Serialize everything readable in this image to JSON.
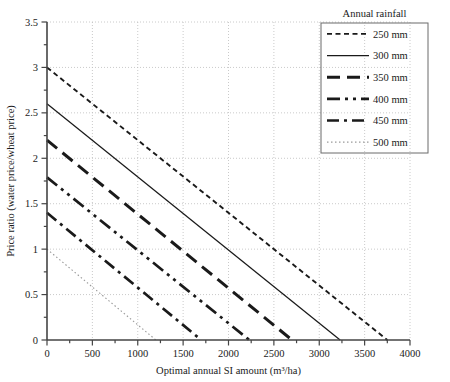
{
  "chart_data": {
    "type": "line",
    "title": "",
    "xlabel": "Optimal annual SI amount (m³/ha)",
    "ylabel": "Price ratio (water price/wheat price)",
    "xlim": [
      0,
      4000
    ],
    "ylim": [
      0,
      3.5
    ],
    "xticks": [
      0,
      500,
      1000,
      1500,
      2000,
      2500,
      3000,
      3500,
      4000
    ],
    "xtick_labels": [
      "0",
      "500",
      "1000",
      "1500",
      "2000",
      "2500",
      "3000",
      "3500",
      "4000"
    ],
    "yticks": [
      0,
      0.5,
      1,
      1.5,
      2,
      2.5,
      3,
      3.5
    ],
    "ytick_labels": [
      "0",
      "0.5",
      "1",
      "1.5",
      "2",
      "2.5",
      "3",
      "3.5"
    ],
    "x_minor_step": 250,
    "y_minor_step": 0.25,
    "grid": true,
    "grid_style": "dotted",
    "grid_color": "#bdbdbd",
    "legend_position": "top-right-outside",
    "legend_title": "Annual rainfall",
    "series": [
      {
        "name": "250 mm",
        "label": "250 mm",
        "style": "dashed-fine",
        "dasharray": "5,3.5",
        "width": 1.9,
        "color": "#1a1a1a",
        "x": [
          0,
          3750
        ],
        "y": [
          3.0,
          0.0
        ],
        "y_intercept": 3.0,
        "x_intercept": 3750
      },
      {
        "name": "300 mm",
        "label": "300 mm",
        "style": "solid",
        "dasharray": "",
        "width": 1.25,
        "color": "#1a1a1a",
        "x": [
          0,
          3230
        ],
        "y": [
          2.6,
          0.0
        ],
        "y_intercept": 2.6,
        "x_intercept": 3230
      },
      {
        "name": "350 mm",
        "label": "350 mm",
        "style": "long-dash",
        "dasharray": "13,7",
        "width": 3.0,
        "color": "#1a1a1a",
        "x": [
          0,
          2700
        ],
        "y": [
          2.2,
          0.0
        ],
        "y_intercept": 2.2,
        "x_intercept": 2700
      },
      {
        "name": "400 mm",
        "label": "400 mm",
        "style": "dash-dot-dot",
        "dasharray": "13,5,3,5,3,5",
        "width": 2.7,
        "color": "#1a1a1a",
        "x": [
          0,
          2230
        ],
        "y": [
          1.79,
          0.0
        ],
        "y_intercept": 1.79,
        "x_intercept": 2230
      },
      {
        "name": "450 mm",
        "label": "450 mm",
        "style": "dash-dot",
        "dasharray": "12,5,3,5",
        "width": 2.7,
        "color": "#1a1a1a",
        "x": [
          0,
          1700
        ],
        "y": [
          1.4,
          0.0
        ],
        "y_intercept": 1.4,
        "x_intercept": 1700
      },
      {
        "name": "500 mm",
        "label": "500 mm",
        "style": "fine-dotted",
        "dasharray": "1.5,2.5",
        "width": 1.1,
        "color": "#9a9a9a",
        "x": [
          0,
          1200
        ],
        "y": [
          1.0,
          0.0
        ],
        "y_intercept": 1.0,
        "x_intercept": 1200
      }
    ]
  }
}
